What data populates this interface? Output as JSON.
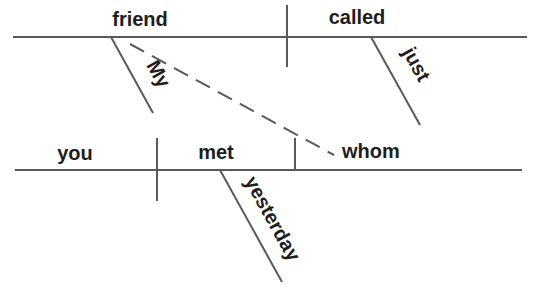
{
  "diagram": {
    "type": "sentence-diagram",
    "sentence": "My friend whom you met yesterday just called",
    "colors": {
      "line": "#5a5a5a",
      "text": "#1e1e1e",
      "background": "#ffffff"
    },
    "main_clause": {
      "subject": "friend",
      "verb": "called",
      "subject_modifier": "My",
      "verb_modifier": "just"
    },
    "relative_clause": {
      "subject": "you",
      "verb": "met",
      "object": "whom",
      "verb_modifier": "yesterday"
    }
  }
}
